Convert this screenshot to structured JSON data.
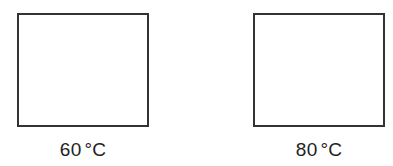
{
  "diagram": {
    "panels": [
      {
        "value": "60",
        "unit": "°C",
        "label": "60 °C"
      },
      {
        "value": "80",
        "unit": "°C",
        "label": "80 °C"
      }
    ],
    "colors": {
      "box_border": "#333333",
      "text": "#222222",
      "background": "#ffffff"
    }
  }
}
